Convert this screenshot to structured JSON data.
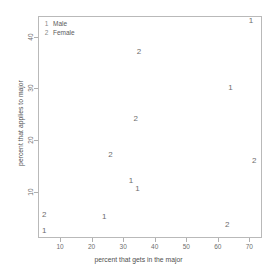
{
  "chart_data": {
    "type": "scatter",
    "title": "",
    "xlabel": "percent that gets in the major",
    "ylabel": "percent that applies to major",
    "xlim": [
      3,
      74
    ],
    "ylim": [
      1,
      44
    ],
    "xticks": [
      10,
      20,
      30,
      40,
      50,
      60,
      70
    ],
    "yticks": [
      10,
      20,
      30,
      40
    ],
    "grid": false,
    "legend_position": "top-left",
    "legend": [
      {
        "key": "1",
        "label": "Male"
      },
      {
        "key": "2",
        "label": "Female"
      }
    ],
    "series": [
      {
        "name": "Male",
        "marker": "1",
        "points": [
          {
            "x": 70.5,
            "y": 43.0
          },
          {
            "x": 64.0,
            "y": 30.0
          },
          {
            "x": 32.5,
            "y": 12.0
          },
          {
            "x": 34.5,
            "y": 10.4
          },
          {
            "x": 24.0,
            "y": 5.0
          },
          {
            "x": 5.0,
            "y": 2.4
          }
        ]
      },
      {
        "name": "Female",
        "marker": "2",
        "points": [
          {
            "x": 35.0,
            "y": 37.0
          },
          {
            "x": 34.0,
            "y": 24.0
          },
          {
            "x": 26.0,
            "y": 17.0
          },
          {
            "x": 71.5,
            "y": 16.0
          },
          {
            "x": 5.0,
            "y": 5.5
          },
          {
            "x": 63.0,
            "y": 3.6
          }
        ]
      }
    ]
  }
}
